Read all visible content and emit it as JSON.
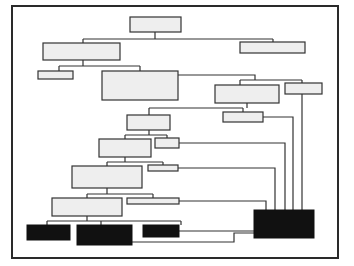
{
  "diagram": {
    "type": "hierarchy-tree",
    "frame": {
      "x": 11,
      "y": 5,
      "w": 326,
      "h": 252,
      "border_color": "#2a2a2a"
    },
    "colors": {
      "light_box_fill": "#eeeeee",
      "box_stroke": "#333333",
      "dark_box_fill": "#111111",
      "connector": "#333333"
    },
    "nodes": [
      {
        "id": "n1",
        "x": 130,
        "y": 17,
        "w": 51,
        "h": 15,
        "style": "light"
      },
      {
        "id": "n2",
        "x": 43,
        "y": 43,
        "w": 77,
        "h": 17,
        "style": "light"
      },
      {
        "id": "n3",
        "x": 240,
        "y": 42,
        "w": 65,
        "h": 11,
        "style": "light"
      },
      {
        "id": "n4",
        "x": 38,
        "y": 71,
        "w": 35,
        "h": 8,
        "style": "light"
      },
      {
        "id": "n5",
        "x": 102,
        "y": 71,
        "w": 76,
        "h": 29,
        "style": "light"
      },
      {
        "id": "n6",
        "x": 215,
        "y": 85,
        "w": 64,
        "h": 18,
        "style": "light"
      },
      {
        "id": "n7",
        "x": 285,
        "y": 83,
        "w": 37,
        "h": 11,
        "style": "light"
      },
      {
        "id": "n8",
        "x": 127,
        "y": 115,
        "w": 43,
        "h": 15,
        "style": "light"
      },
      {
        "id": "n9",
        "x": 223,
        "y": 112,
        "w": 40,
        "h": 10,
        "style": "light"
      },
      {
        "id": "n10",
        "x": 99,
        "y": 139,
        "w": 52,
        "h": 18,
        "style": "light"
      },
      {
        "id": "n11",
        "x": 155,
        "y": 138,
        "w": 24,
        "h": 10,
        "style": "light"
      },
      {
        "id": "n12",
        "x": 72,
        "y": 166,
        "w": 70,
        "h": 22,
        "style": "light"
      },
      {
        "id": "n13",
        "x": 148,
        "y": 165,
        "w": 30,
        "h": 6,
        "style": "light"
      },
      {
        "id": "n14",
        "x": 52,
        "y": 198,
        "w": 70,
        "h": 18,
        "style": "light"
      },
      {
        "id": "n15",
        "x": 127,
        "y": 198,
        "w": 52,
        "h": 6,
        "style": "light"
      },
      {
        "id": "n16",
        "x": 27,
        "y": 225,
        "w": 43,
        "h": 15,
        "style": "dark"
      },
      {
        "id": "n17",
        "x": 77,
        "y": 225,
        "w": 55,
        "h": 20,
        "style": "dark"
      },
      {
        "id": "n18",
        "x": 143,
        "y": 225,
        "w": 36,
        "h": 12,
        "style": "dark"
      },
      {
        "id": "n19",
        "x": 254,
        "y": 210,
        "w": 60,
        "h": 28,
        "style": "dark"
      }
    ],
    "connectors": [
      "M155,32 V39 M83,39 H273 M83,39 V43 M273,39 V42",
      "M83,60 V66 M59,66 H140 M59,66 V71 M140,66 V71",
      "M178,75 H255 V80 M240,80 H302 M240,80 V85 M302,80 V83",
      "M247,103 V108 M149,108 H243 M149,108 V115 M243,108 V112",
      "M149,130 V135 M125,135 H167 M125,135 V139 M167,135 V138",
      "M125,157 V162 M107,162 H163 M107,162 V166 M163,162 V165",
      "M107,188 V194 M87,194 H153 M87,194 V198 M153,194 V198",
      "M87,216 V221 M47,221 H181 M47,221 V225 M101,221 V225 M181,221 V225",
      "M302,94 V210",
      "M263,117 H293 V210",
      "M179,143 H285 V210",
      "M178,168 H275 V210",
      "M179,201 H266 V210",
      "M179,231 H254",
      "M132,242 H234 V233 H254"
    ]
  }
}
